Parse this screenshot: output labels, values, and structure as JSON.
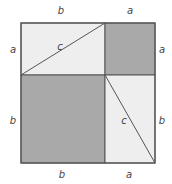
{
  "diagram": {
    "colors": {
      "light_fill": "#eeeeee",
      "dark_fill": "#a9a9a9",
      "stroke": "#555555",
      "label": "#444444"
    },
    "labels": {
      "top_left": "b",
      "top_right": "a",
      "left_top": "a",
      "left_bottom": "b",
      "right_top": "a",
      "right_bottom": "b",
      "bottom_left": "b",
      "bottom_right": "a",
      "hyp_top": "c",
      "hyp_bottom": "c"
    },
    "regions": [
      {
        "name": "top-left-rectangle",
        "shade": "light"
      },
      {
        "name": "top-right-square",
        "shade": "dark"
      },
      {
        "name": "bottom-left-square",
        "shade": "dark"
      },
      {
        "name": "bottom-right-rectangle",
        "shade": "light"
      }
    ]
  }
}
